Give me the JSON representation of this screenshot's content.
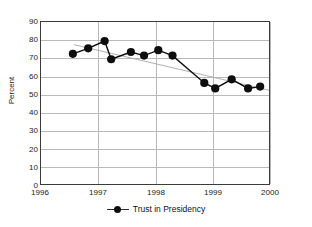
{
  "chart_data": {
    "type": "line",
    "title": "",
    "xlabel": "",
    "ylabel": "Percent",
    "xlim": [
      1996,
      2000.2
    ],
    "ylim": [
      0,
      90
    ],
    "ytick_step": 10,
    "yticks": [
      "90",
      "80",
      "70",
      "60",
      "50",
      "40",
      "30",
      "20",
      "10",
      "0"
    ],
    "xticks": [
      "1996",
      "1997",
      "1998",
      "1999",
      "2000"
    ],
    "grid": "horizontal-and-vertical",
    "legend_position": "bottom-center",
    "series": [
      {
        "name": "Trust in Presidency",
        "marker": "filled-circle",
        "color": "#0e0e0e",
        "x": [
          1996.6,
          1996.88,
          1997.18,
          1997.3,
          1997.66,
          1997.9,
          1998.16,
          1998.42,
          1999.0,
          1999.2,
          1999.5,
          1999.8,
          2000.02
        ],
        "values": [
          72,
          75,
          79,
          69,
          73,
          71,
          74,
          71,
          56,
          53,
          58,
          53,
          54
        ]
      },
      {
        "name": "trendline",
        "marker": "none",
        "color": "#a8a8a8",
        "x": [
          1996.62,
          2000.18
        ],
        "values": [
          77,
          52
        ]
      }
    ]
  },
  "axes": {
    "y_label": "Percent"
  },
  "legend": {
    "entries": [
      {
        "label": "Trust in Presidency",
        "swatch": "line-with-circle-marker"
      }
    ]
  }
}
